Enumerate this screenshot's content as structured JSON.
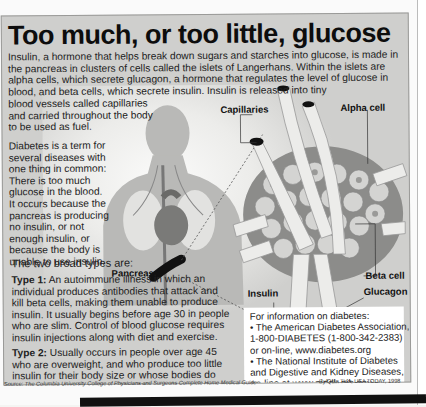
{
  "title": "Too much, or too little, glucose",
  "intro": "Insulin, a hormone that helps break down sugars and starches into glucose, is made in the pancreas in clusters of cells called the islets of Langerhans.  Within the islets are alpha cells, which secrete glucagon, a hormone that regulates the level of glucose in blood, and beta cells, which secrete insulin. Insulin is released into tiny",
  "intro_tail": "blood vessels called capillaries and carried throughout the body to be used as fuel.",
  "diabetes_definition": "Diabetes is a term for several diseases with one thing in common: There is too much glucose in the blood. It occurs because the pancreas is producing no insulin, or not enough insulin, or because the body is unable to use insulin.",
  "types": {
    "heading": "The two broad types are:",
    "items": [
      {
        "label": "Type 1:",
        "text": " An autoimmune illness in which an individual produces antibodies that attack and kill beta cells, making them unable to produce insulin. It usually begins before age 30 in people who are slim. Control of blood glucose requires insulin injections along with diet and exercise."
      },
      {
        "label": "Type 2:",
        "text": " Usually occurs in people over age 45 who are overweight, and who produce too little insulin for their body size or whose bodies do not respond properly to insulin's action."
      }
    ]
  },
  "diagram_labels": {
    "capillaries": "Capillaries",
    "alpha_cell": "Alpha cell",
    "pancreas": "Pancreas",
    "beta_cell": "Beta cell",
    "insulin": "Insulin",
    "glucagon": "Glucagon"
  },
  "info_box": {
    "heading": "For information on diabetes:",
    "lines": [
      "• The American Diabetes Association,",
      "1-800-DIABETES (1-800-342-2383)",
      "or on-line, www.diabetes.org",
      "• The National Institute of Diabetes",
      "and Digestive and Kidney Diseases,",
      "on-line at www.niddk.nih.gov"
    ]
  },
  "source": {
    "prefix": "Source: ",
    "text": "The Columbia University College of Physicians and Surgeons Complete Home Medical Guide"
  },
  "byline": "By Quin Tian, USA TODAY, 1998",
  "colors": {
    "panel": "#cfcfcd",
    "title": "#0d0d0d",
    "body_silhouette": "#b9b9b7",
    "heart": "#7a7a78",
    "islet": "#8c8c8a",
    "cell": "#d4d4d2"
  }
}
